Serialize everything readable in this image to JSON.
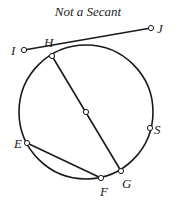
{
  "title": "Not a Secant",
  "colors": {
    "stroke": "#1a1a1a",
    "point_fill": "#ffffff",
    "text": "#222222",
    "background": "#ffffff"
  },
  "circle": {
    "cx": 86,
    "cy": 112,
    "r": 67
  },
  "center_point": {
    "x": 86,
    "y": 112
  },
  "points": [
    {
      "name": "I",
      "label": "I",
      "x": 24,
      "y": 50,
      "label_x": 11,
      "label_y": 55
    },
    {
      "name": "J",
      "label": "J",
      "x": 151,
      "y": 28,
      "label_x": 157,
      "label_y": 33
    },
    {
      "name": "H",
      "label": "H",
      "x": 52,
      "y": 56,
      "label_x": 44,
      "label_y": 47
    },
    {
      "name": "S",
      "label": "S",
      "x": 150,
      "y": 128,
      "label_x": 154,
      "label_y": 134
    },
    {
      "name": "E",
      "label": "E",
      "x": 27,
      "y": 143,
      "label_x": 14,
      "label_y": 148
    },
    {
      "name": "F",
      "label": "F",
      "x": 101,
      "y": 178,
      "label_x": 100,
      "label_y": 196
    },
    {
      "name": "G",
      "label": "G",
      "x": 121,
      "y": 171,
      "label_x": 122,
      "label_y": 188
    }
  ],
  "segments": [
    {
      "name": "line-IJ",
      "from": "I",
      "to": "J"
    },
    {
      "name": "diameter-HG",
      "from": "H",
      "to": "G"
    },
    {
      "name": "chord-EF",
      "from": "E",
      "to": "F"
    }
  ]
}
